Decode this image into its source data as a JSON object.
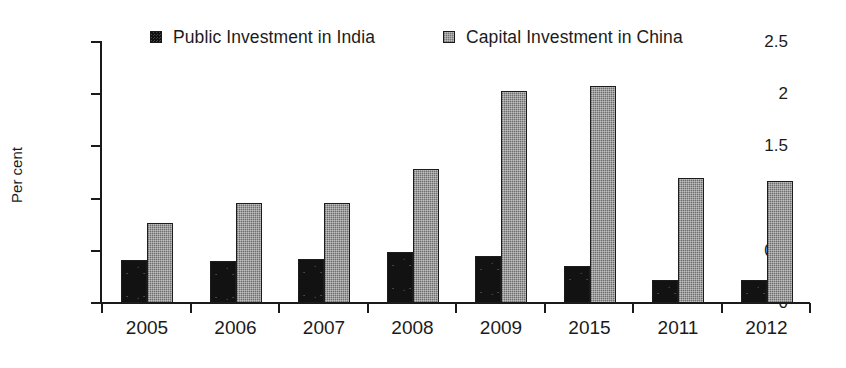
{
  "chart_data": {
    "type": "bar",
    "title": "",
    "subtitle": "",
    "xlabel": "",
    "ylabel": "Per cent",
    "categories": [
      "2005",
      "2006",
      "2007",
      "2008",
      "2009",
      "2015",
      "2011",
      "2012"
    ],
    "series": [
      {
        "name": "Public Investment in India",
        "color": "#121212",
        "values": [
          0.41,
          0.4,
          0.42,
          0.49,
          0.45,
          0.35,
          0.22,
          0.22
        ]
      },
      {
        "name": "Capital Investment in China",
        "color": "#9d9d9d",
        "values": [
          0.77,
          0.96,
          0.96,
          1.28,
          2.03,
          2.08,
          1.2,
          1.17
        ]
      }
    ],
    "ylim": [
      0,
      2.5
    ],
    "yticks": [
      0,
      0.5,
      1,
      1.5,
      2,
      2.5
    ],
    "ytick_labels": [
      "0",
      "0.5",
      "1",
      "1.5",
      "2",
      "2.5"
    ],
    "grid": false,
    "legend_position": "top-center",
    "annotations": []
  },
  "legend": {
    "entries": [
      {
        "label": "Public Investment in India",
        "swatch": "black-square-marker"
      },
      {
        "label": "Capital Investment in China",
        "swatch": "gray-square-marker"
      }
    ]
  },
  "axis": {
    "y_title": "Per cent"
  }
}
